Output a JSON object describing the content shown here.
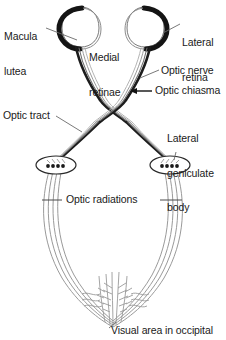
{
  "figure": {
    "background_color": "#ffffff",
    "ink_color": "#1a1a1a",
    "dark_retina_color": "#111111",
    "tract_color": "#555555",
    "fine_line_color": "#8a8a8a"
  },
  "labels": {
    "macula_lutea_line1": "Macula",
    "macula_lutea_line2": "lutea",
    "medial_retinae_line1": "Medial",
    "medial_retinae_line2": "retinae",
    "lateral_retina_line1": "Lateral",
    "lateral_retina_line2": "retina",
    "optic_nerve": "Optic nerve",
    "optic_chiasma": "Optic chiasma",
    "optic_tract": "Optic tract",
    "lateral_geniculate_line1": "Lateral",
    "lateral_geniculate_line2": "geniculate",
    "lateral_geniculate_line3": "body",
    "optic_radiations": "Optic radiations",
    "visual_area": "Visual area in occipital"
  },
  "structures": {
    "eye_left_name": "left-eyeball",
    "eye_right_name": "right-eyeball",
    "chiasma_name": "optic-chiasma-crossing",
    "lgb_left_name": "left-lateral-geniculate-body",
    "lgb_right_name": "right-lateral-geniculate-body",
    "lgb_dot_count": 4,
    "cortex_name": "occipital-visual-cortex"
  }
}
